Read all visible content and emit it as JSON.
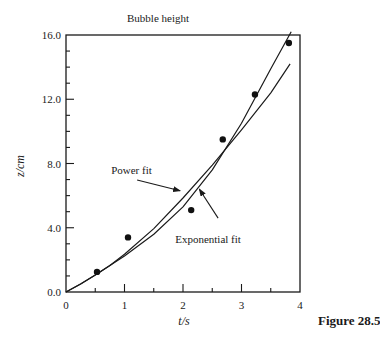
{
  "figure_label": "Figure 28.5",
  "chart_data": {
    "type": "scatter",
    "title": "Bubble height",
    "xlabel": "t/s",
    "ylabel": "z/cm",
    "xlim": [
      0,
      4
    ],
    "ylim": [
      0,
      16
    ],
    "x_ticks_major": [
      0,
      1,
      2,
      3,
      4
    ],
    "x_tick_labels": [
      "0",
      "1",
      "2",
      "3",
      "4"
    ],
    "x_ticks_minor": [
      0.5,
      1.5,
      2.5,
      3.5
    ],
    "y_ticks_major": [
      0,
      4,
      8,
      12,
      16
    ],
    "y_tick_labels": [
      "0.0",
      "4.0",
      "8.0",
      "12.0",
      "16.0"
    ],
    "y_ticks_minor": [
      1,
      2,
      3,
      5,
      6,
      7,
      9,
      10,
      11,
      13,
      14,
      15
    ],
    "grid": false,
    "legend": "none (inline annotations)",
    "series": [
      {
        "name": "data",
        "kind": "points",
        "x": [
          0.53,
          1.06,
          2.14,
          2.68,
          3.23,
          3.81
        ],
        "y": [
          1.25,
          3.4,
          5.1,
          9.5,
          12.3,
          15.5
        ]
      },
      {
        "name": "Power fit",
        "kind": "line",
        "x": [
          0,
          0.25,
          0.5,
          0.75,
          1.0,
          1.5,
          2.0,
          2.5,
          3.0,
          3.5,
          3.83
        ],
        "y": [
          0,
          0.5,
          1.05,
          1.65,
          2.35,
          3.95,
          5.85,
          7.9,
          10.1,
          12.4,
          14.2
        ]
      },
      {
        "name": "Exponential fit",
        "kind": "line",
        "x": [
          0,
          0.25,
          0.5,
          0.75,
          1.0,
          1.5,
          2.0,
          2.5,
          3.0,
          3.5,
          3.85
        ],
        "y": [
          0,
          0.5,
          1.05,
          1.65,
          2.25,
          3.6,
          5.3,
          7.6,
          10.5,
          13.9,
          16.2
        ]
      }
    ],
    "annotations": [
      {
        "text": "Power fit",
        "text_x": 1.25,
        "text_y": 7.6,
        "arrow_to_x": 1.95,
        "arrow_to_y": 6.3
      },
      {
        "text": "Exponential fit",
        "text_x": 2.55,
        "text_y": 3.3,
        "arrow_from_x": 2.6,
        "arrow_from_y": 4.6,
        "arrow_to_x": 2.28,
        "arrow_to_y": 6.4
      }
    ]
  }
}
